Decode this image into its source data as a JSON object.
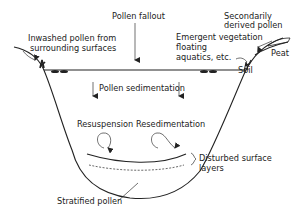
{
  "diagram": {
    "labels": {
      "pollen_fallout": "Pollen fallout",
      "inwashed_1": "Inwashed pollen from",
      "inwashed_2": "surrounding surfaces",
      "secondary_1": "Secondarily",
      "secondary_2": "derived pollen",
      "emergent_1": "Emergent vegetation",
      "emergent_2": "floating",
      "emergent_3": "aquatics, etc.",
      "peat": "Peat",
      "soil": "Soil",
      "pollen_sedimentation": "Pollen sedimentation",
      "resuspension": "Resuspension",
      "resedimentation": "Resedimentation",
      "disturbed_1": "Disturbed surface",
      "disturbed_2": "layers",
      "stratified": "Stratified pollen"
    },
    "colors": {
      "line": "#222222",
      "background": "#ffffff"
    }
  }
}
